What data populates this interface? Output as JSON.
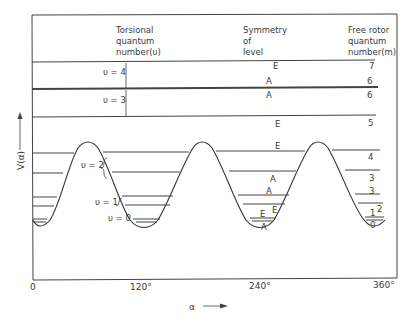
{
  "diagram": {
    "headers": {
      "torsional": [
        "Torsional",
        "quantum",
        "number(υ)"
      ],
      "symmetry": [
        "Symmetry",
        "of",
        "level"
      ],
      "free_rotor": [
        "Free rotor",
        "quantum",
        "number(m)"
      ]
    },
    "y_axis_label": "V(α)",
    "x_axis_label": "α",
    "x_ticks": [
      "0",
      "120°",
      "240°",
      "360°"
    ],
    "torsional_labels": [
      "υ = 4",
      "υ = 3",
      "υ = 2",
      "υ = 1",
      "υ = 0"
    ],
    "levels": [
      {
        "symmetry": "E",
        "m": "7"
      },
      {
        "symmetry": "A",
        "m": "6"
      },
      {
        "symmetry": "A",
        "m": "6"
      },
      {
        "symmetry": "E",
        "m": "5"
      },
      {
        "symmetry": "E",
        "m": "4"
      },
      {
        "symmetry": "A",
        "m": "3"
      },
      {
        "symmetry": "A",
        "m": "3"
      },
      {
        "symmetry": "E",
        "m": "2"
      },
      {
        "symmetry": "E",
        "m": "1"
      },
      {
        "symmetry": "A",
        "m": "0"
      }
    ],
    "colors": {
      "line": "#333333",
      "background": "#ffffff"
    }
  }
}
